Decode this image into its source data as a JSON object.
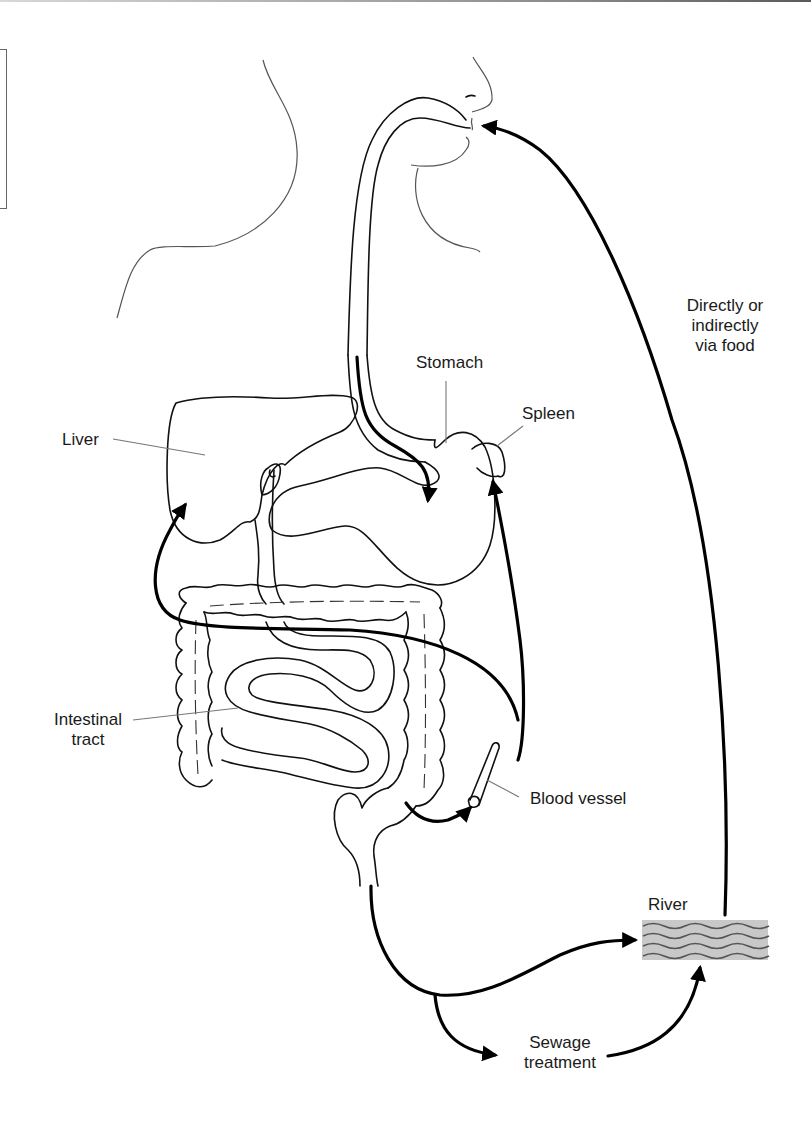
{
  "diagram": {
    "labels": {
      "liver": "Liver",
      "stomach": "Stomach",
      "spleen": "Spleen",
      "intestinal_tract": [
        "Intestinal",
        "tract"
      ],
      "blood_vessel": "Blood vessel",
      "river": "River",
      "sewage_treatment": [
        "Sewage",
        "treatment"
      ],
      "directly_or_indirectly": [
        "Directly or",
        "indirectly",
        "via food"
      ]
    },
    "flows": [
      {
        "from": "mouth",
        "to": "stomach",
        "label": ""
      },
      {
        "from": "intestinal tract",
        "to": "liver",
        "label": ""
      },
      {
        "from": "blood vessel",
        "to": "spleen",
        "label": ""
      },
      {
        "from": "colon",
        "to": "blood vessel",
        "label": ""
      },
      {
        "from": "anus",
        "to": "river",
        "label": ""
      },
      {
        "from": "anus",
        "to": "sewage treatment",
        "label": ""
      },
      {
        "from": "sewage treatment",
        "to": "river",
        "label": ""
      },
      {
        "from": "river",
        "to": "mouth",
        "label": "Directly or indirectly via food"
      }
    ],
    "colors": {
      "line": "#000000",
      "organ_outline": "#111111",
      "leader": "#777777",
      "river_fill": "#c8c8c8",
      "river_wave": "#555555"
    }
  }
}
